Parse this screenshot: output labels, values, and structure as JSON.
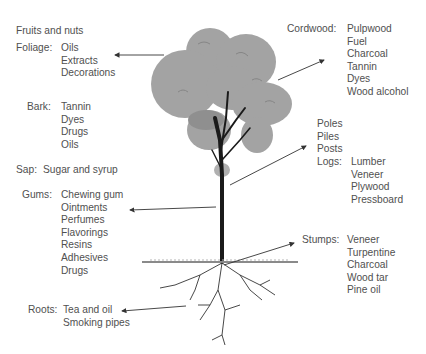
{
  "diagram": {
    "colors": {
      "text": "#505050",
      "foliage": "#9a9a9a",
      "trunk": "#1a1a1a",
      "arrow": "#333333"
    },
    "groups": [
      {
        "id": "fruits",
        "label": "Fruits and nuts",
        "items": []
      },
      {
        "id": "foliage",
        "label": "Foliage:",
        "items": [
          "Oils",
          "Extracts",
          "Decorations"
        ]
      },
      {
        "id": "bark",
        "label": "Bark:",
        "items": [
          "Tannin",
          "Dyes",
          "Drugs",
          "Oils"
        ]
      },
      {
        "id": "sap",
        "label": "Sap:",
        "items": [
          "Sugar and syrup"
        ]
      },
      {
        "id": "gums",
        "label": "Gums:",
        "items": [
          "Chewing gum",
          "Ointments",
          "Perfumes",
          "Flavorings",
          "Resins",
          "Adhesives",
          "Drugs"
        ]
      },
      {
        "id": "roots",
        "label": "Roots:",
        "items": [
          "Tea and oil",
          "Smoking pipes"
        ]
      },
      {
        "id": "cordwood",
        "label": "Cordwood:",
        "items": [
          "Pulpwood",
          "Fuel",
          "Charcoal",
          "Tannin",
          "Dyes",
          "Wood alcohol"
        ]
      },
      {
        "id": "trunk",
        "label": "",
        "items": [
          "Poles",
          "Piles",
          "Posts"
        ]
      },
      {
        "id": "logs",
        "label": "Logs:",
        "items": [
          "Lumber",
          "Veneer",
          "Plywood",
          "Pressboard"
        ]
      },
      {
        "id": "stumps",
        "label": "Stumps:",
        "items": [
          "Veneer",
          "Turpentine",
          "Charcoal",
          "Wood tar",
          "Pine oil"
        ]
      }
    ]
  }
}
